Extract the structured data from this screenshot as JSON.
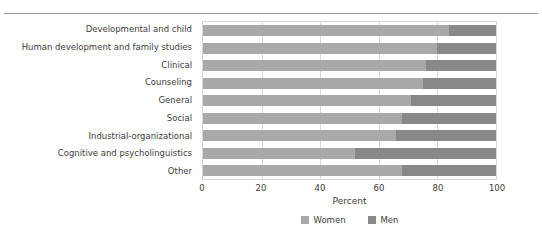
{
  "chart_data": {
    "type": "bar",
    "orientation": "horizontal",
    "stacked": true,
    "title": "",
    "xlabel": "Percent",
    "ylabel": "",
    "xlim": [
      0,
      100
    ],
    "xticks": [
      0,
      20,
      40,
      60,
      80,
      100
    ],
    "grid": true,
    "legend_position": "bottom",
    "categories": [
      "Developmental and child",
      "Human development and family studies",
      "Clinical",
      "Counseling",
      "General",
      "Social",
      "Industrial-organizational",
      "Cognitive and psycholinguistics",
      "Other"
    ],
    "series": [
      {
        "name": "Women",
        "color": "#a9a9a9",
        "values": [
          84,
          80,
          76,
          75,
          71,
          68,
          66,
          52,
          68
        ]
      },
      {
        "name": "Men",
        "color": "#888888",
        "values": [
          16,
          20,
          24,
          25,
          29,
          32,
          34,
          48,
          32
        ]
      }
    ]
  },
  "axis": {
    "x_title": "Percent",
    "tick_labels": [
      "0",
      "20",
      "40",
      "60",
      "80",
      "100"
    ]
  },
  "legend": {
    "items": [
      {
        "label": "Women",
        "color": "#a9a9a9"
      },
      {
        "label": "Men",
        "color": "#888888"
      }
    ]
  }
}
